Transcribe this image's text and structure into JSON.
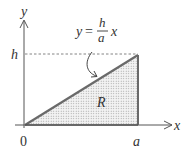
{
  "diagram": {
    "axes": {
      "x_label": "x",
      "y_label": "y",
      "origin_label": "0"
    },
    "ticks": {
      "x_tick_label": "a",
      "y_tick_label": "h"
    },
    "region_label": "R",
    "equation": {
      "lhs": "y",
      "equals": "=",
      "numerator": "h",
      "denominator": "a",
      "variable": "x"
    },
    "colors": {
      "axis": "#555555",
      "triangle_edge": "#6a6a6a",
      "fill_dots": "#9a9a9a",
      "text": "#333333"
    }
  }
}
